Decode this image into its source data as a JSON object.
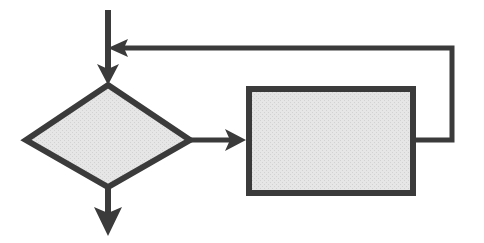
{
  "diagram": {
    "type": "flowchart",
    "background_color": "#ffffff",
    "shape_fill_color": "#e6e6e6",
    "shape_stroke_color": "#3b3b3b",
    "connector_color": "#3b3b3b",
    "stroke_width": 6,
    "connector_width": 5,
    "nodes": [
      {
        "id": "decision",
        "shape": "diamond",
        "label": "",
        "left": 26,
        "right": 190,
        "top": 85,
        "bottom": 187,
        "center_x": 108,
        "center_y": 140
      },
      {
        "id": "process",
        "shape": "rectangle",
        "label": "",
        "left": 246,
        "right": 416,
        "top": 86,
        "bottom": 196,
        "center_x": 331,
        "center_y": 141
      }
    ],
    "connectors": [
      {
        "id": "entry",
        "name": "entry-arrow",
        "from": "top-edge",
        "to": "decision",
        "direction": "down",
        "arrowhead": "down",
        "points": "108,10 108,78",
        "label": ""
      },
      {
        "id": "decision-to-process",
        "name": "decision-to-process-arrow",
        "from": "decision",
        "to": "process",
        "direction": "right",
        "arrowhead": "right",
        "points": "190,140 240,140",
        "label": ""
      },
      {
        "id": "feedback-loop",
        "name": "feedback-loop-arrow",
        "from": "process",
        "to": "entry-junction",
        "direction": "right-up-left",
        "arrowhead": "left",
        "points": "416,140 452,140 452,48 118,48",
        "label": ""
      },
      {
        "id": "exit",
        "name": "exit-arrow",
        "from": "decision",
        "to": "bottom-edge",
        "direction": "down",
        "arrowhead": "down",
        "points": "108,187 108,227",
        "label": ""
      }
    ]
  }
}
